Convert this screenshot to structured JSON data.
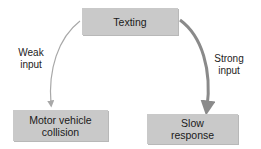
{
  "diagram": {
    "nodes": {
      "source": {
        "label": "Texting"
      },
      "left_outcome": {
        "label_line1": "Motor vehicle",
        "label_line2": "collision"
      },
      "right_outcome": {
        "label_line1": "Slow",
        "label_line2": "response"
      }
    },
    "edges": {
      "weak": {
        "label_line1": "Weak",
        "label_line2": "input",
        "color": "#a8a8a8"
      },
      "strong": {
        "label_line1": "Strong",
        "label_line2": "input",
        "color": "#8a8a8a"
      }
    },
    "colors": {
      "box_fill": "#c9c9c9",
      "background": "#ffffff"
    }
  }
}
